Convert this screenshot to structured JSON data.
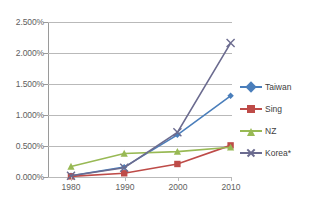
{
  "chart_data": {
    "type": "line",
    "title": "",
    "xlabel": "",
    "ylabel": "",
    "categories": [
      "1980",
      "1990",
      "2000",
      "2010"
    ],
    "x": [
      1980,
      1990,
      2000,
      2010
    ],
    "ylim": [
      0,
      2.5
    ],
    "y_unit": "percent",
    "ytick_labels": [
      "2.500%",
      "2.000%",
      "1.500%",
      "1.000%",
      "0.500%",
      "0.000%"
    ],
    "ytick_values": [
      2.5,
      2.0,
      1.5,
      1.0,
      0.5,
      0.0
    ],
    "xtick_labels": [
      "1980",
      "1990",
      "2000",
      "2010"
    ],
    "grid": "horizontal",
    "legend_position": "right",
    "series": [
      {
        "name": "Taiwan",
        "color": "#4a7ebb",
        "marker": "diamond",
        "values": [
          0.02,
          0.16,
          0.68,
          1.31
        ]
      },
      {
        "name": "Sing",
        "color": "#be4b48",
        "marker": "square",
        "values": [
          0.01,
          0.06,
          0.21,
          0.51
        ]
      },
      {
        "name": "NZ",
        "color": "#98b954",
        "marker": "triangle",
        "values": [
          0.17,
          0.38,
          0.41,
          0.48
        ]
      },
      {
        "name": "Korea*",
        "color": "#6b6b8f",
        "marker": "x",
        "values": [
          0.02,
          0.15,
          0.72,
          2.16
        ]
      }
    ]
  },
  "axes": {
    "y_labels": [
      "2.500%",
      "2.000%",
      "1.500%",
      "1.000%",
      "0.500%",
      "0.000%"
    ],
    "x_labels": [
      "1980",
      "1990",
      "2000",
      "2010"
    ]
  },
  "legend": {
    "items": [
      {
        "label": "Taiwan"
      },
      {
        "label": "Sing"
      },
      {
        "label": "NZ"
      },
      {
        "label": "Korea*"
      }
    ]
  }
}
